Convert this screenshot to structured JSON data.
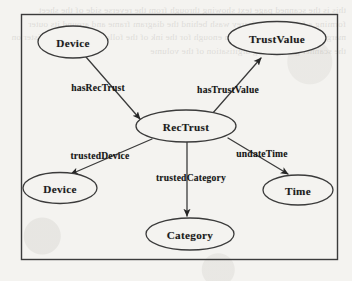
{
  "figure": {
    "frame": {
      "x": 21,
      "y": 14,
      "width": 317,
      "height": 246
    },
    "stroke_color": "#3b3b3b",
    "text_color": "#1b1b1b",
    "background_color": "#f4f3f0",
    "nodes": [
      {
        "id": "device-top",
        "label": "Device",
        "cx": 73,
        "cy": 42,
        "rx": 35,
        "ry": 16
      },
      {
        "id": "trustvalue",
        "label": "TrustValue",
        "cx": 277,
        "cy": 38,
        "rx": 49,
        "ry": 16.5
      },
      {
        "id": "rectrust",
        "label": "RecTrust",
        "cx": 186,
        "cy": 126,
        "rx": 50,
        "ry": 16
      },
      {
        "id": "device-bottom",
        "label": "Device",
        "cx": 60,
        "cy": 188,
        "rx": 37,
        "ry": 15.5
      },
      {
        "id": "time",
        "label": "Time",
        "cx": 298,
        "cy": 190,
        "rx": 35,
        "ry": 15
      },
      {
        "id": "category",
        "label": "Category",
        "cx": 190,
        "cy": 234,
        "rx": 44,
        "ry": 16
      }
    ],
    "edges": [
      {
        "id": "has-rec-trust",
        "label": "hasRecTrust",
        "from": "device-top",
        "to": "rectrust",
        "label_x": 98,
        "label_y": 87,
        "x1": 86,
        "y1": 57,
        "x2": 140,
        "y2": 119,
        "arrow": "target"
      },
      {
        "id": "has-trust-value",
        "label": "hasTrustValue",
        "from": "rectrust",
        "to": "trustvalue",
        "label_x": 228,
        "label_y": 89,
        "x1": 212,
        "y1": 114,
        "x2": 261,
        "y2": 58,
        "arrow": "target"
      },
      {
        "id": "trusted-device",
        "label": "trustedDevice",
        "from": "rectrust",
        "to": "device-bottom",
        "label_x": 100,
        "label_y": 155,
        "x1": 152,
        "y1": 139,
        "x2": 71,
        "y2": 174,
        "arrow": "target"
      },
      {
        "id": "trusted-category",
        "label": "trustedCategory",
        "from": "rectrust",
        "to": "category",
        "label_x": 191,
        "label_y": 177,
        "x1": 187,
        "y1": 142,
        "x2": 187,
        "y2": 216,
        "arrow": "target"
      },
      {
        "id": "undate-time",
        "label": "undateTime",
        "from": "rectrust",
        "to": "time",
        "label_x": 262,
        "label_y": 153,
        "x1": 228,
        "y1": 138,
        "x2": 288,
        "y2": 174,
        "arrow": "target"
      }
    ]
  },
  "bleed_text": "this is the scanned page text showing through from the reverse side of the sheet forming a faint mirrored grey wash behind the diagram frame and around its outer margins where the paper is thin enough for the ink of the following page to register on the scanner glass during digitisation of the volume"
}
